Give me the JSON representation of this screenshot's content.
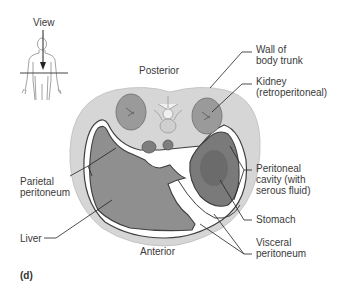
{
  "figure": {
    "panel_label": "(d)",
    "view_label": "View",
    "orientation": {
      "top": "Posterior",
      "bottom": "Anterior"
    },
    "labels_right": [
      {
        "id": "wall",
        "text": "Wall of\nbody trunk"
      },
      {
        "id": "kidney",
        "text": "Kidney\n(retroperitoneal)"
      },
      {
        "id": "cavity",
        "text": "Peritoneal\ncavity (with\nserous fluid)"
      },
      {
        "id": "stomach",
        "text": "Stomach"
      },
      {
        "id": "visceral",
        "text": "Visceral\nperitoneum"
      }
    ],
    "labels_left": [
      {
        "id": "parietal",
        "text": "Parietal\nperitoneum"
      },
      {
        "id": "liver",
        "text": "Liver"
      }
    ],
    "colors": {
      "body_wall": "#d6d6d6",
      "organ": "#8e8e8e",
      "kidney": "#9a9a9a",
      "outline": "#3f3f3f",
      "cavity": "#ffffff"
    }
  }
}
